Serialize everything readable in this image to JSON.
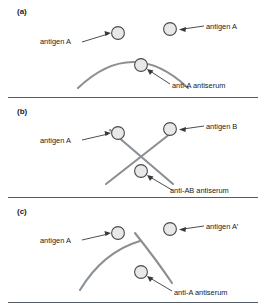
{
  "figure": {
    "colors": {
      "precipitin_line": "#8a8f94",
      "arrow": "#3a3a3a",
      "well_fill": "#e8e8e8",
      "well_stroke": "#4a4a4a",
      "divider": "#555c63",
      "text": "#1a1a1a"
    }
  },
  "panels": [
    {
      "id": "a",
      "label": "(a)",
      "pattern": "identity",
      "wells": [
        {
          "name": "antigen-a-left",
          "label": "antigen A"
        },
        {
          "name": "antigen-a-right",
          "label": "antigen A"
        },
        {
          "name": "antiserum",
          "label": "anti-A antiserum"
        }
      ],
      "labels": {
        "left_antigen": "antigen A",
        "right_antigen": "antigen A",
        "antiserum": "anti-A antiserum"
      }
    },
    {
      "id": "b",
      "label": "(b)",
      "pattern": "non-identity",
      "wells": [
        {
          "name": "antigen-a-left",
          "label": "antigen A"
        },
        {
          "name": "antigen-b-right",
          "label": "antigen B"
        },
        {
          "name": "antiserum",
          "label": "anti-AB antiserum"
        }
      ],
      "labels": {
        "left_antigen": "antigen A",
        "right_antigen": "antigen B",
        "antiserum": "anti-AB antiserum"
      }
    },
    {
      "id": "c",
      "label": "(c)",
      "pattern": "partial-identity",
      "wells": [
        {
          "name": "antigen-a-left",
          "label": "antigen A"
        },
        {
          "name": "antigen-a-prime-right",
          "label": "antigen A′"
        },
        {
          "name": "antiserum",
          "label": "anti-A antiserum"
        }
      ],
      "labels": {
        "left_antigen": "antigen A",
        "right_antigen": "antigen A′",
        "antiserum": "anti-A antiserum"
      }
    }
  ]
}
